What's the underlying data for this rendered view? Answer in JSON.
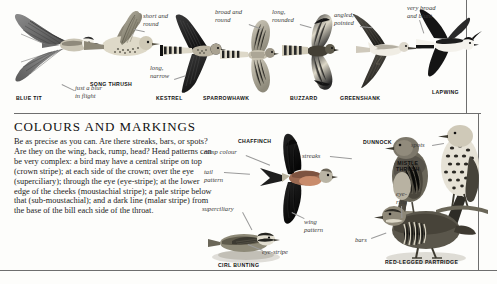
{
  "page": {
    "section_heading": "COLOURS AND MARKINGS",
    "body_text": "Be as precise as you can. Are there streaks, bars, or spots? Are they on the wing, back, rump, head? Head patterns can be very complex: a bird may have a central stripe on top (crown stripe); at each side of the crown; over the eye (superciliary); through the eye (eye-stripe); at the lower edge of the cheeks (moustachial stripe); a pale stripe below that (sub-moustachial); and a dark line (malar stripe) from the base of the bill each side of the throat."
  },
  "top_panel": {
    "species": [
      {
        "name": "BLUE TIT"
      },
      {
        "name": "SONG THRUSH"
      },
      {
        "name": "KESTREL"
      },
      {
        "name": "SPARROWHAWK"
      },
      {
        "name": "BUZZARD"
      },
      {
        "name": "GREENSHANK"
      },
      {
        "name": "LAPWING"
      }
    ],
    "annotations": [
      {
        "text": "just a blur\nin flight"
      },
      {
        "text": "short and\nround"
      },
      {
        "text": "long,\nnarrow"
      },
      {
        "text": "broad and\nround"
      },
      {
        "text": "long,\nrounded"
      },
      {
        "text": "angled,\npointed"
      },
      {
        "text": "very broad\nand blunt"
      }
    ]
  },
  "bottom_panel": {
    "species": [
      {
        "name": "CHAFFINCH"
      },
      {
        "name": "CIRL BUNTING"
      },
      {
        "name": "DUNNOCK"
      },
      {
        "name": "MISTLE\nTHRUSH"
      },
      {
        "name": "RED-LEGGED PARTRIDGE"
      }
    ],
    "annotations": [
      {
        "text": "rump colour"
      },
      {
        "text": "tail\npattern"
      },
      {
        "text": "superciliary"
      },
      {
        "text": "eye-stripe"
      },
      {
        "text": "wing\npattern"
      },
      {
        "text": "streaks"
      },
      {
        "text": "spots"
      },
      {
        "text": "eye-\nring"
      },
      {
        "text": "bars"
      }
    ]
  },
  "colors": {
    "page_background": "#fdfdfb",
    "rule": "#6e6e6e",
    "text": "#1c1c1c",
    "annotation": "#3a3a3a"
  }
}
